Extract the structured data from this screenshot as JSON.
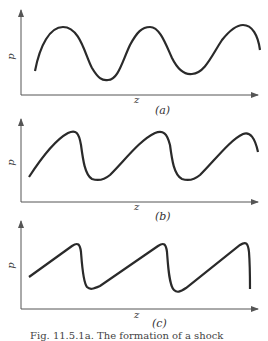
{
  "figure": {
    "panels": [
      {
        "id": "a",
        "label": "(a)",
        "xlabel": "z",
        "ylabel": "p",
        "description": "smooth sinusoidal pressure wave"
      },
      {
        "id": "b",
        "label": "(b)",
        "xlabel": "z",
        "ylabel": "p",
        "description": "steepening wave front"
      },
      {
        "id": "c",
        "label": "(c)",
        "xlabel": "z",
        "ylabel": "p",
        "description": "sawtooth shock waves"
      }
    ],
    "caption": "Fig. 11.5.1a. The formation of a shock"
  },
  "colors": {
    "curve": "#2a2a2a",
    "axis": "#555555",
    "background": "#ffffff"
  }
}
